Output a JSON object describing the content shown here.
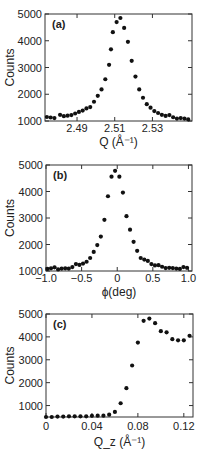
{
  "figure": {
    "panel_count": 3
  },
  "chart_data": [
    {
      "type": "scatter",
      "panel_label": "(a)",
      "title": "",
      "xlabel": "Q (Å⁻¹)",
      "ylabel": "Counts",
      "xlim": [
        2.473,
        2.551
      ],
      "ylim": [
        1000,
        5000
      ],
      "xticks": [
        2.49,
        2.51,
        2.53
      ],
      "xtick_labels": [
        "2.49",
        "2.51",
        "2.53"
      ],
      "yticks": [
        1000,
        2000,
        3000,
        4000,
        5000
      ],
      "ytick_labels": [
        "1000",
        "2000",
        "3000",
        "4000",
        "5000"
      ],
      "grid": false,
      "legend": null,
      "series": [
        {
          "name": "Q scan",
          "x": [
            2.474,
            2.476,
            2.478,
            2.481,
            2.483,
            2.485,
            2.487,
            2.489,
            2.491,
            2.493,
            2.495,
            2.497,
            2.499,
            2.501,
            2.503,
            2.505,
            2.507,
            2.508,
            2.509,
            2.511,
            2.513,
            2.515,
            2.517,
            2.519,
            2.521,
            2.523,
            2.525,
            2.527,
            2.529,
            2.531,
            2.533,
            2.535,
            2.537,
            2.539,
            2.541,
            2.543,
            2.545,
            2.547,
            2.549
          ],
          "y": [
            1150,
            1130,
            1110,
            1230,
            1180,
            1200,
            1220,
            1280,
            1340,
            1390,
            1470,
            1520,
            1720,
            1940,
            2180,
            2560,
            3100,
            3680,
            4320,
            4700,
            4850,
            4480,
            3960,
            3250,
            2660,
            2180,
            1870,
            1630,
            1500,
            1370,
            1300,
            1230,
            1190,
            1220,
            1140,
            1090,
            1110,
            1090,
            1060
          ]
        }
      ]
    },
    {
      "type": "scatter",
      "panel_label": "(b)",
      "title": "",
      "xlabel": "ϕ(deg)",
      "ylabel": "Counts",
      "xlim": [
        -1.0,
        1.05
      ],
      "ylim": [
        1000,
        5000
      ],
      "xticks": [
        -1.0,
        -0.5,
        0,
        0.5,
        1.0
      ],
      "xtick_labels": [
        "−1.0",
        "−0.5",
        "0",
        "0.5",
        "1.0"
      ],
      "yticks": [
        1000,
        2000,
        3000,
        4000,
        5000
      ],
      "ytick_labels": [
        "1000",
        "2000",
        "3000",
        "4000",
        "5000"
      ],
      "grid": false,
      "legend": null,
      "series": [
        {
          "name": "phi scan",
          "x": [
            -0.98,
            -0.93,
            -0.88,
            -0.83,
            -0.78,
            -0.73,
            -0.68,
            -0.63,
            -0.58,
            -0.53,
            -0.48,
            -0.43,
            -0.38,
            -0.33,
            -0.28,
            -0.23,
            -0.18,
            -0.13,
            -0.08,
            -0.03,
            0.03,
            0.08,
            0.13,
            0.18,
            0.23,
            0.28,
            0.33,
            0.38,
            0.43,
            0.48,
            0.53,
            0.58,
            0.63,
            0.68,
            0.73,
            0.78,
            0.83,
            0.88,
            0.93,
            0.98
          ],
          "y": [
            1080,
            1100,
            1140,
            1060,
            1090,
            1100,
            1090,
            1150,
            1260,
            1230,
            1280,
            1350,
            1490,
            1720,
            1980,
            2300,
            2930,
            3820,
            4560,
            4780,
            4560,
            3960,
            3070,
            2560,
            2100,
            1760,
            1490,
            1430,
            1380,
            1260,
            1210,
            1220,
            1160,
            1110,
            1120,
            1110,
            1090,
            1080,
            1150,
            1120
          ]
        }
      ]
    },
    {
      "type": "scatter",
      "panel_label": "(c)",
      "title": "",
      "xlabel": "Q_z (Å⁻¹)",
      "ylabel": "Counts",
      "xlim": [
        0,
        0.128
      ],
      "ylim": [
        500,
        5000
      ],
      "xticks": [
        0,
        0.04,
        0.08,
        0.12
      ],
      "xtick_labels": [
        "0",
        "0.04",
        "0.08",
        "0.12"
      ],
      "yticks": [
        1000,
        2000,
        3000,
        4000,
        5000
      ],
      "ytick_labels": [
        "1000",
        "2000",
        "3000",
        "4000",
        "5000"
      ],
      "grid": false,
      "legend": null,
      "series": [
        {
          "name": "Qz scan",
          "x": [
            0,
            0.005,
            0.01,
            0.015,
            0.02,
            0.025,
            0.03,
            0.035,
            0.04,
            0.045,
            0.05,
            0.055,
            0.06,
            0.065,
            0.07,
            0.075,
            0.08,
            0.085,
            0.09,
            0.095,
            0.1,
            0.105,
            0.11,
            0.115,
            0.12,
            0.125
          ],
          "y": [
            500,
            500,
            520,
            520,
            530,
            530,
            530,
            530,
            550,
            560,
            560,
            600,
            720,
            1100,
            1760,
            2750,
            3750,
            4700,
            4800,
            4600,
            4250,
            4200,
            3900,
            3850,
            3850,
            4050
          ]
        }
      ]
    }
  ]
}
